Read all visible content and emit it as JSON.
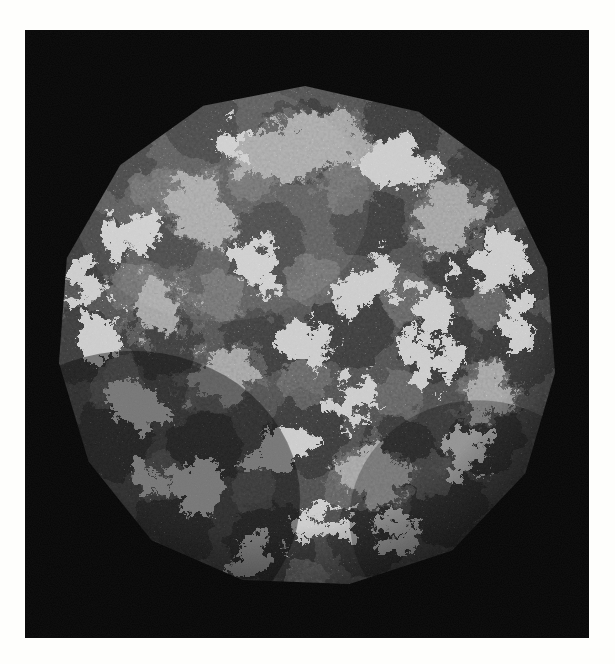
{
  "figure": {
    "domain_kind": "electron-micrograph-style molecular surface rendering",
    "subject": "icosahedral virus capsid outer surface",
    "plate": {
      "background_color": "#070707",
      "page_background_color": "#fdfdfb",
      "left": 26,
      "top": 31,
      "width": 562,
      "height": 606
    },
    "particle": {
      "shape": "quasi-spherical icosahedral particle with faceted rim",
      "center_x": 305,
      "center_y": 335,
      "radius": 252,
      "surface_texture": "fine granular bead-like molecular surface",
      "dark_domain_color": "#3a3a3a",
      "mid_domain_color": "#6a6a6a",
      "light_domain_color": "#cfcfcf",
      "highlight_color": "#e8e8e4",
      "shadow_color": "#141414",
      "light_patch_coverage_percent": 22,
      "lighting": "diffuse top-left key light with terminator toward lower-left rim"
    },
    "symmetry": {
      "type": "icosahedral",
      "triangulation_note": "pseudo T=3 style capsomer packing",
      "visible_fivefold_axes": 6,
      "visible_threefold_axes": 10
    },
    "light_patches": [
      {
        "cx": 0.5,
        "cy": 0.13,
        "rx": 0.11,
        "ry": 0.055,
        "rot": -18
      },
      {
        "cx": 0.67,
        "cy": 0.16,
        "rx": 0.085,
        "ry": 0.04,
        "rot": 20
      },
      {
        "cx": 0.29,
        "cy": 0.25,
        "rx": 0.075,
        "ry": 0.055,
        "rot": 35
      },
      {
        "cx": 0.14,
        "cy": 0.3,
        "rx": 0.055,
        "ry": 0.045,
        "rot": 0
      },
      {
        "cx": 0.78,
        "cy": 0.27,
        "rx": 0.065,
        "ry": 0.05,
        "rot": -30
      },
      {
        "cx": 0.88,
        "cy": 0.35,
        "rx": 0.05,
        "ry": 0.06,
        "rot": 10
      },
      {
        "cx": 0.4,
        "cy": 0.36,
        "rx": 0.05,
        "ry": 0.04,
        "rot": 45
      },
      {
        "cx": 0.62,
        "cy": 0.4,
        "rx": 0.07,
        "ry": 0.045,
        "rot": -40
      },
      {
        "cx": 0.22,
        "cy": 0.45,
        "rx": 0.06,
        "ry": 0.05,
        "rot": 15
      },
      {
        "cx": 0.5,
        "cy": 0.52,
        "rx": 0.055,
        "ry": 0.04,
        "rot": 0
      },
      {
        "cx": 0.33,
        "cy": 0.58,
        "rx": 0.075,
        "ry": 0.05,
        "rot": -25
      },
      {
        "cx": 0.74,
        "cy": 0.55,
        "rx": 0.06,
        "ry": 0.05,
        "rot": 30
      },
      {
        "cx": 0.86,
        "cy": 0.62,
        "rx": 0.05,
        "ry": 0.04,
        "rot": -10
      },
      {
        "cx": 0.17,
        "cy": 0.64,
        "rx": 0.055,
        "ry": 0.045,
        "rot": 20
      },
      {
        "cx": 0.45,
        "cy": 0.72,
        "rx": 0.06,
        "ry": 0.04,
        "rot": -15
      },
      {
        "cx": 0.64,
        "cy": 0.78,
        "rx": 0.07,
        "ry": 0.04,
        "rot": 25
      },
      {
        "cx": 0.28,
        "cy": 0.8,
        "rx": 0.05,
        "ry": 0.04,
        "rot": 0
      },
      {
        "cx": 0.52,
        "cy": 0.88,
        "rx": 0.055,
        "ry": 0.035,
        "rot": -20
      },
      {
        "cx": 0.76,
        "cy": 0.44,
        "rx": 0.045,
        "ry": 0.05,
        "rot": 0
      },
      {
        "cx": 0.1,
        "cy": 0.5,
        "rx": 0.04,
        "ry": 0.05,
        "rot": 0
      }
    ]
  }
}
